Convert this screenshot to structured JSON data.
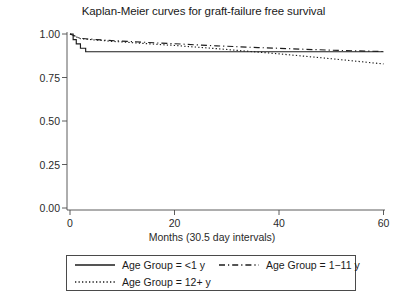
{
  "chart_data": {
    "type": "line",
    "title": "Kaplan-Meier curves for graft-failure free survival",
    "xlabel": "Months (30.5 day intervals)",
    "ylabel": "",
    "xlim": [
      0,
      62
    ],
    "ylim": [
      0,
      1.0
    ],
    "xticks": [
      0,
      20,
      40,
      60
    ],
    "xtick_labels": [
      "0",
      "20",
      "40",
      "60"
    ],
    "yticks": [
      0.0,
      0.25,
      0.5,
      0.75,
      1.0
    ],
    "ytick_labels": [
      "0.00",
      "0.25",
      "0.50",
      "0.75",
      "1.00"
    ],
    "grid": false,
    "legend_position": "below-axes",
    "series": [
      {
        "name": "Age Group = <1 y",
        "style": "solid",
        "x": [
          0,
          0.6,
          0.6,
          1.2,
          1.2,
          2.0,
          2.0,
          3.0,
          3.0,
          60
        ],
        "y": [
          1.0,
          1.0,
          0.968,
          0.968,
          0.943,
          0.943,
          0.918,
          0.918,
          0.898,
          0.898
        ]
      },
      {
        "name": "Age Group = 1−11 y",
        "style": "dashed",
        "x": [
          0,
          2,
          5,
          8,
          11,
          14,
          17,
          20,
          24,
          28,
          32,
          36,
          40,
          45,
          50,
          55,
          60
        ],
        "y": [
          1.0,
          0.975,
          0.968,
          0.962,
          0.958,
          0.953,
          0.948,
          0.944,
          0.938,
          0.932,
          0.927,
          0.922,
          0.918,
          0.912,
          0.907,
          0.903,
          0.899
        ]
      },
      {
        "name": "Age Group = 12+ y",
        "style": "dotted",
        "x": [
          0,
          2,
          5,
          8,
          11,
          14,
          17,
          20,
          24,
          28,
          32,
          36,
          40,
          45,
          50,
          55,
          60
        ],
        "y": [
          1.0,
          0.973,
          0.965,
          0.958,
          0.952,
          0.946,
          0.94,
          0.934,
          0.925,
          0.916,
          0.906,
          0.896,
          0.886,
          0.872,
          0.858,
          0.843,
          0.828
        ]
      }
    ]
  },
  "legend": {
    "entries": [
      {
        "label": "Age Group = <1 y",
        "style": "solid"
      },
      {
        "label": "Age Group = 1−11 y",
        "style": "dashed"
      },
      {
        "label": "Age Group = 12+ y",
        "style": "dotted"
      }
    ]
  }
}
